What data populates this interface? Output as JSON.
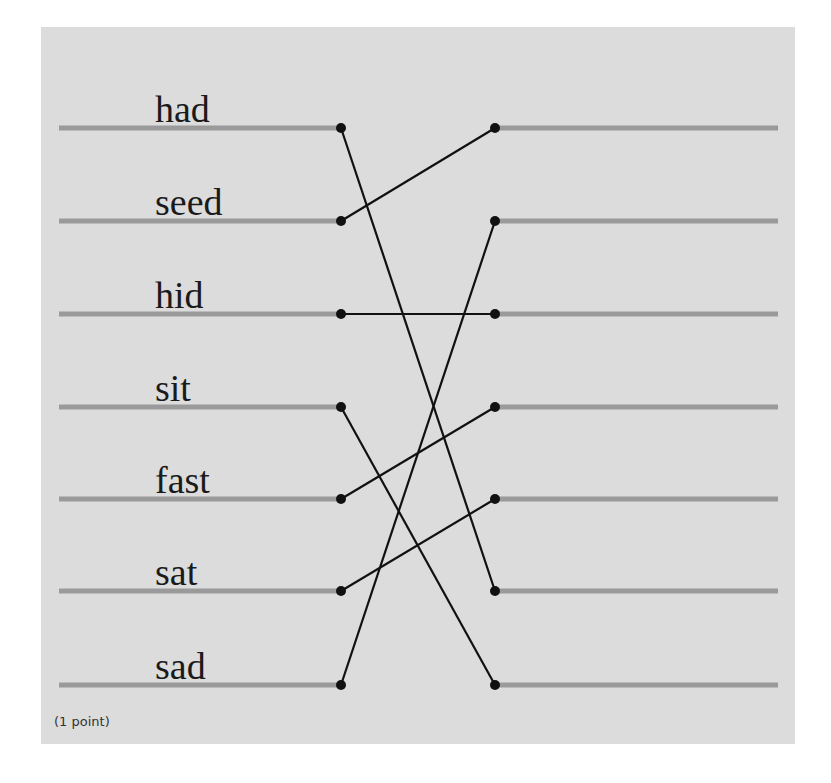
{
  "activity": {
    "left_words": [
      "had",
      "seed",
      "hid",
      "sit",
      "fast",
      "sat",
      "sad"
    ],
    "right_slots": 7,
    "connections": [
      {
        "from": "had",
        "left_index": 0,
        "right_index": 5
      },
      {
        "from": "seed",
        "left_index": 1,
        "right_index": 0
      },
      {
        "from": "hid",
        "left_index": 2,
        "right_index": 2
      },
      {
        "from": "sit",
        "left_index": 3,
        "right_index": 6
      },
      {
        "from": "fast",
        "left_index": 4,
        "right_index": 3
      },
      {
        "from": "sat",
        "left_index": 5,
        "right_index": 4
      },
      {
        "from": "sad",
        "left_index": 6,
        "right_index": 1
      }
    ],
    "footnote": "(1 point)"
  },
  "colors": {
    "panel_background": "#dcdcdc",
    "line": "#9a9a9a",
    "connector": "#111111"
  }
}
